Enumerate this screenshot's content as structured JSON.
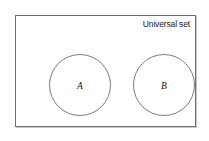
{
  "diagram": {
    "type": "venn",
    "title": "",
    "universal_set_label": "Universal set",
    "relation": "disjoint",
    "background_color": "#ffffff",
    "border_color": "#6e6e6e",
    "circle_stroke_color": "#7b7b7b",
    "text_color": "#1a1a1a",
    "sets": [
      {
        "label": "A",
        "cx": 64,
        "cy": 69,
        "r": 31
      },
      {
        "label": "B",
        "cx": 148,
        "cy": 69,
        "r": 31
      }
    ],
    "universal_rect": {
      "x": 15,
      "y": 15,
      "width": 181,
      "height": 112
    }
  }
}
